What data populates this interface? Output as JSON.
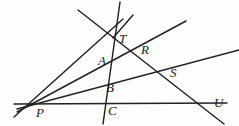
{
  "figure": {
    "background_color": "#fdfdfc",
    "line_color": "#222222",
    "label_color": "#1a1a1a",
    "width": 239,
    "height": 126,
    "points": [
      {
        "id": "P",
        "label": "P",
        "x": 38,
        "y": 105,
        "label_x": 36,
        "label_y": 106,
        "role": "pencil-vertex"
      },
      {
        "id": "T",
        "label": "T",
        "x": 113,
        "y": 38,
        "label_x": 119,
        "label_y": 32,
        "role": "intersection"
      },
      {
        "id": "A",
        "label": "A",
        "x": 106,
        "y": 62,
        "label_x": 98,
        "label_y": 54,
        "role": "intersection"
      },
      {
        "id": "B",
        "label": "B",
        "x": 110,
        "y": 88,
        "label_x": 106,
        "label_y": 81,
        "role": "intersection"
      },
      {
        "id": "C",
        "label": "C",
        "x": 113,
        "y": 105,
        "label_x": 108,
        "label_y": 104,
        "role": "intersection"
      },
      {
        "id": "R",
        "label": "R",
        "x": 145,
        "y": 50,
        "label_x": 141,
        "label_y": 43,
        "role": "intersection"
      },
      {
        "id": "S",
        "label": "S",
        "x": 174,
        "y": 71,
        "label_x": 170,
        "label_y": 66,
        "role": "intersection"
      },
      {
        "id": "U",
        "label": "U",
        "x": 213,
        "y": 103,
        "label_x": 214,
        "label_y": 96,
        "role": "endpoint"
      }
    ],
    "lines": [
      {
        "id": "line-P-T",
        "name": "ray-P-through-T",
        "x1": 14,
        "y1": 117,
        "x2": 123,
        "y2": 19
      },
      {
        "id": "line-P-A-R",
        "name": "ray-P-through-A-R",
        "x1": 17,
        "y1": 112,
        "x2": 186,
        "y2": 21
      },
      {
        "id": "line-P-B-S",
        "name": "ray-P-through-B-S",
        "x1": 17,
        "y1": 109,
        "x2": 239,
        "y2": 50
      },
      {
        "id": "line-P-C-U",
        "name": "line-P-through-C-U",
        "x1": 14,
        "y1": 104,
        "x2": 227,
        "y2": 103
      },
      {
        "id": "line-steep-TABC",
        "name": "steep-line-T-A-B-C",
        "x1": 120,
        "y1": 2,
        "x2": 103,
        "y2": 124
      },
      {
        "id": "line-T-R-S-U",
        "name": "line-T-R-S-U-descending",
        "x1": 78,
        "y1": 10,
        "x2": 224,
        "y2": 124
      },
      {
        "id": "line-T-short",
        "name": "short-segment-above-T",
        "x1": 133,
        "y1": 15,
        "x2": 113,
        "y2": 38
      }
    ]
  }
}
